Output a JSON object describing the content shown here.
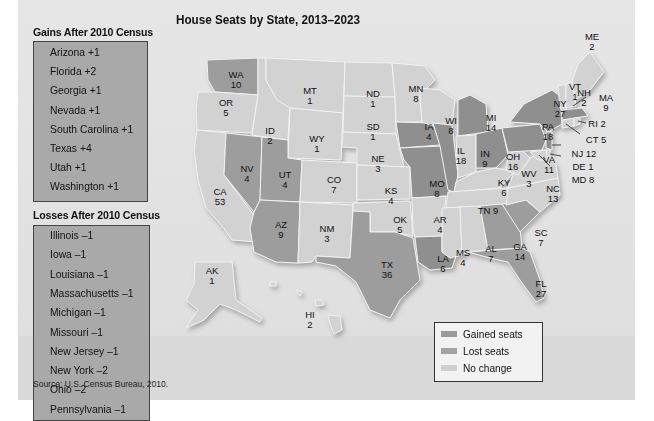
{
  "map_title": "House Seats by State, 2013–2023",
  "source": "Source: U.S. Census Bureau, 2010.",
  "colors": {
    "gained": "#9a9a9a",
    "lost": "#a3a3a3",
    "no_change": "#cfcfcf",
    "gained_map": "#9d9d9d",
    "lost_map": "#8f8f8f",
    "no_change_map": "#d2d2d2"
  },
  "gains": {
    "title": "Gains After 2010 Census",
    "items": [
      {
        "state": "Arizona",
        "change": "+1"
      },
      {
        "state": "Florida",
        "change": "+2"
      },
      {
        "state": "Georgia",
        "change": "+1"
      },
      {
        "state": "Nevada",
        "change": "+1"
      },
      {
        "state": "South Carolina",
        "change": "+1"
      },
      {
        "state": "Texas",
        "change": "+4"
      },
      {
        "state": "Utah",
        "change": "+1"
      },
      {
        "state": "Washington",
        "change": "+1"
      }
    ]
  },
  "losses": {
    "title": "Losses After 2010 Census",
    "items": [
      {
        "state": "Illinois",
        "change": "–1"
      },
      {
        "state": "Iowa",
        "change": "–1"
      },
      {
        "state": "Louisiana",
        "change": "–1"
      },
      {
        "state": "Massachusetts",
        "change": "–1"
      },
      {
        "state": "Michigan",
        "change": "–1"
      },
      {
        "state": "Missouri",
        "change": "–1"
      },
      {
        "state": "New Jersey",
        "change": "–1"
      },
      {
        "state": "New York",
        "change": "–2"
      },
      {
        "state": "Ohio",
        "change": "–2"
      },
      {
        "state": "Pennsylvania",
        "change": "–1"
      }
    ]
  },
  "legend": [
    {
      "label": "Gained seats",
      "status": "gained"
    },
    {
      "label": "Lost seats",
      "status": "lost"
    },
    {
      "label": "No change",
      "status": "no_change"
    }
  ],
  "states": [
    {
      "abbr": "WA",
      "seats": "10",
      "status": "gained"
    },
    {
      "abbr": "OR",
      "seats": "5",
      "status": "no_change"
    },
    {
      "abbr": "CA",
      "seats": "53",
      "status": "no_change"
    },
    {
      "abbr": "ID",
      "seats": "2",
      "status": "no_change"
    },
    {
      "abbr": "NV",
      "seats": "4",
      "status": "gained"
    },
    {
      "abbr": "MT",
      "seats": "1",
      "status": "no_change"
    },
    {
      "abbr": "WY",
      "seats": "1",
      "status": "no_change"
    },
    {
      "abbr": "UT",
      "seats": "4",
      "status": "gained"
    },
    {
      "abbr": "AZ",
      "seats": "9",
      "status": "gained"
    },
    {
      "abbr": "CO",
      "seats": "7",
      "status": "no_change"
    },
    {
      "abbr": "NM",
      "seats": "3",
      "status": "no_change"
    },
    {
      "abbr": "ND",
      "seats": "1",
      "status": "no_change"
    },
    {
      "abbr": "SD",
      "seats": "1",
      "status": "no_change"
    },
    {
      "abbr": "NE",
      "seats": "3",
      "status": "no_change"
    },
    {
      "abbr": "KS",
      "seats": "4",
      "status": "no_change"
    },
    {
      "abbr": "OK",
      "seats": "5",
      "status": "no_change"
    },
    {
      "abbr": "TX",
      "seats": "36",
      "status": "gained"
    },
    {
      "abbr": "MN",
      "seats": "8",
      "status": "no_change"
    },
    {
      "abbr": "IA",
      "seats": "4",
      "status": "lost"
    },
    {
      "abbr": "MO",
      "seats": "8",
      "status": "lost"
    },
    {
      "abbr": "AR",
      "seats": "4",
      "status": "no_change"
    },
    {
      "abbr": "LA",
      "seats": "6",
      "status": "lost"
    },
    {
      "abbr": "WI",
      "seats": "8",
      "status": "no_change"
    },
    {
      "abbr": "IL",
      "seats": "18",
      "status": "lost"
    },
    {
      "abbr": "MI",
      "seats": "14",
      "status": "lost"
    },
    {
      "abbr": "IN",
      "seats": "9",
      "status": "no_change"
    },
    {
      "abbr": "OH",
      "seats": "16",
      "status": "lost"
    },
    {
      "abbr": "KY",
      "seats": "6",
      "status": "no_change"
    },
    {
      "abbr": "TN",
      "seats": "9",
      "status": "no_change"
    },
    {
      "abbr": "MS",
      "seats": "4",
      "status": "no_change"
    },
    {
      "abbr": "AL",
      "seats": "7",
      "status": "no_change"
    },
    {
      "abbr": "GA",
      "seats": "14",
      "status": "gained"
    },
    {
      "abbr": "FL",
      "seats": "27",
      "status": "gained"
    },
    {
      "abbr": "SC",
      "seats": "7",
      "status": "gained"
    },
    {
      "abbr": "NC",
      "seats": "13",
      "status": "no_change"
    },
    {
      "abbr": "VA",
      "seats": "11",
      "status": "no_change"
    },
    {
      "abbr": "WV",
      "seats": "3",
      "status": "no_change"
    },
    {
      "abbr": "PA",
      "seats": "18",
      "status": "lost"
    },
    {
      "abbr": "NY",
      "seats": "27",
      "status": "lost"
    },
    {
      "abbr": "VT",
      "seats": "1",
      "status": "no_change"
    },
    {
      "abbr": "NH",
      "seats": "2",
      "status": "no_change"
    },
    {
      "abbr": "ME",
      "seats": "2",
      "status": "no_change"
    },
    {
      "abbr": "MA",
      "seats": "9",
      "status": "lost"
    },
    {
      "abbr": "RI",
      "seats": "2",
      "status": "no_change"
    },
    {
      "abbr": "CT",
      "seats": "5",
      "status": "no_change"
    },
    {
      "abbr": "NJ",
      "seats": "12",
      "status": "lost"
    },
    {
      "abbr": "DE",
      "seats": "1",
      "status": "no_change"
    },
    {
      "abbr": "MD",
      "seats": "8",
      "status": "no_change"
    },
    {
      "abbr": "AK",
      "seats": "1",
      "status": "no_change"
    },
    {
      "abbr": "HI",
      "seats": "2",
      "status": "no_change"
    }
  ],
  "callout_labels": {
    "RI": "RI 2",
    "CT": "CT 5",
    "NJ": "NJ 12",
    "DE": "DE 1",
    "MD": "MD 8",
    "TN": "TN 9"
  }
}
